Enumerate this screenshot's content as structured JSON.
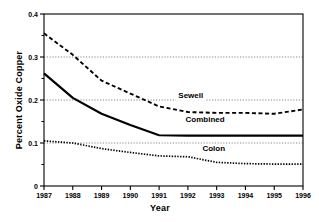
{
  "chart_data": {
    "type": "line",
    "title": "",
    "xlabel": "Year",
    "ylabel": "Percent Oxide Copper",
    "x": [
      1987,
      1988,
      1989,
      1990,
      1991,
      1992,
      1993,
      1994,
      1995,
      1996
    ],
    "xtick_labels": [
      "1987",
      "1988",
      "1989",
      "1990",
      "1991",
      "1992",
      "1993",
      "1994",
      "1995",
      "1996"
    ],
    "ytick_labels": [
      "0",
      "0.1",
      "0.2",
      "0.3",
      "0.4"
    ],
    "ytick_values": [
      0,
      0.1,
      0.2,
      0.3,
      0.4
    ],
    "yminor_values": [
      0.05,
      0.15,
      0.25,
      0.35
    ],
    "ylim": [
      0,
      0.4
    ],
    "xlim": [
      1987,
      1996
    ],
    "grid": "horizontal-dotted at 0.1, 0.2, 0.3",
    "legend_position": "inline-right-of-each-series",
    "series": [
      {
        "name": "Sewell",
        "style": "dashed",
        "color": "#000000",
        "label_x": 1992.1,
        "label_y": 0.205,
        "values": [
          0.355,
          0.305,
          0.245,
          0.215,
          0.185,
          0.172,
          0.17,
          0.17,
          0.168,
          0.178
        ]
      },
      {
        "name": "Combined",
        "style": "solid",
        "color": "#000000",
        "label_x": 1992.6,
        "label_y": 0.148,
        "values": [
          0.262,
          0.205,
          0.168,
          0.142,
          0.118,
          0.117,
          0.117,
          0.117,
          0.117,
          0.117
        ]
      },
      {
        "name": "Colon",
        "style": "dotted",
        "color": "#000000",
        "label_x": 1992.9,
        "label_y": 0.082,
        "values": [
          0.105,
          0.1,
          0.087,
          0.078,
          0.07,
          0.068,
          0.055,
          0.052,
          0.051,
          0.051
        ]
      }
    ]
  },
  "axes": {
    "y_title": "Percent Oxide Copper",
    "x_title": "Year"
  }
}
